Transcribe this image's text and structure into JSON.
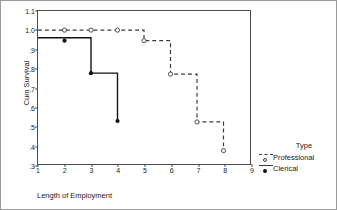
{
  "chart_data": {
    "type": "line",
    "subtype": "kaplan-meier-step",
    "title": "",
    "xlabel": "Length of Employment",
    "ylabel": "Cum Survival",
    "xlim": [
      1,
      9
    ],
    "ylim": [
      0.3,
      1.1
    ],
    "xticks": [
      "1",
      "2",
      "3",
      "4",
      "5",
      "6",
      "7",
      "8",
      "9"
    ],
    "xtick_values": [
      1,
      2,
      3,
      4,
      5,
      6,
      7,
      8,
      9
    ],
    "yticks": [
      ".3",
      ".4",
      ".5",
      ".6",
      ".7",
      ".8",
      ".9",
      "1.0",
      "1.1"
    ],
    "ytick_values": [
      0.3,
      0.4,
      0.5,
      0.6,
      0.7,
      0.8,
      0.9,
      1.0,
      1.1
    ],
    "grid": false,
    "legend_position": "right",
    "legend_title": "Type",
    "series": [
      {
        "name": "Professional",
        "style": "dashed",
        "marker": "open-circle",
        "color": "#3a3a3a",
        "x": [
          1,
          2,
          3,
          4,
          5,
          5,
          6,
          6,
          7,
          7,
          8,
          8
        ],
        "y": [
          1.0,
          1.0,
          1.0,
          1.0,
          1.0,
          0.945,
          0.945,
          0.77,
          0.77,
          0.52,
          0.52,
          0.37
        ],
        "markers": [
          {
            "x": 2,
            "y": 1.0
          },
          {
            "x": 3,
            "y": 1.0
          },
          {
            "x": 4,
            "y": 1.0
          },
          {
            "x": 5,
            "y": 0.945
          },
          {
            "x": 6,
            "y": 0.77
          },
          {
            "x": 7,
            "y": 0.52
          },
          {
            "x": 8,
            "y": 0.37
          }
        ]
      },
      {
        "name": "Clerical",
        "style": "solid",
        "marker": "filled-circle",
        "color": "#111111",
        "x": [
          1,
          2,
          3,
          3,
          4,
          4
        ],
        "y": [
          0.96,
          0.96,
          0.96,
          0.775,
          0.775,
          0.525
        ],
        "markers": [
          {
            "x": 2,
            "y": 0.945
          },
          {
            "x": 3,
            "y": 0.775
          },
          {
            "x": 4,
            "y": 0.525
          }
        ]
      }
    ]
  },
  "legend": {
    "title": "Type",
    "entries": [
      {
        "label": "Professional",
        "style": "dashed",
        "marker": "open"
      },
      {
        "label": "Clerical",
        "style": "solid",
        "marker": "filled"
      }
    ]
  }
}
